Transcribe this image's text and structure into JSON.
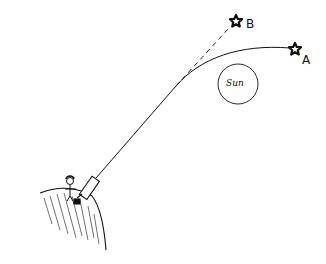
{
  "diagram": {
    "labels": {
      "star_a": "A",
      "star_b": "B",
      "sun": "Sun"
    },
    "colors": {
      "ink": "#111111",
      "background": "#ffffff"
    },
    "elements": [
      {
        "name": "star-a",
        "label": "A",
        "meaning": "actual star position"
      },
      {
        "name": "star-b",
        "label": "B",
        "meaning": "apparent star position"
      },
      {
        "name": "sun",
        "label": "Sun"
      },
      {
        "name": "light-path",
        "style": "solid curve",
        "meaning": "bent light path from A to observer"
      },
      {
        "name": "apparent-line",
        "style": "dashed",
        "meaning": "straight-line extrapolation to B"
      },
      {
        "name": "telescope"
      },
      {
        "name": "observer",
        "meaning": "stick figure"
      },
      {
        "name": "hill",
        "meaning": "Earth surface"
      }
    ]
  }
}
